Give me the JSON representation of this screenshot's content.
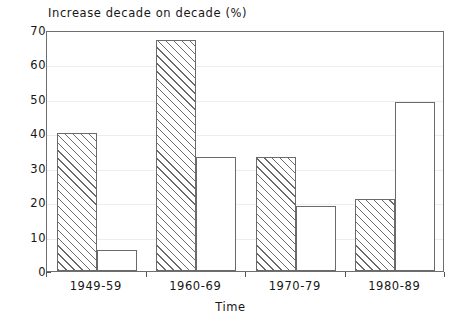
{
  "chart_data": {
    "type": "bar",
    "title": "Increase decade on decade (%)",
    "xlabel": "Time",
    "ylabel": "",
    "categories": [
      "1949-59",
      "1960-69",
      "1970-79",
      "1980-89"
    ],
    "series": [
      {
        "name": "series-1-hatched",
        "style": "hatched",
        "values": [
          40,
          67,
          33,
          21
        ]
      },
      {
        "name": "series-2-plain",
        "style": "plain",
        "values": [
          6,
          33,
          19,
          49
        ]
      }
    ],
    "ylim": [
      0,
      70
    ],
    "yticks": [
      0,
      10,
      20,
      30,
      40,
      50,
      60,
      70
    ],
    "ytick_labels": [
      "0",
      "10",
      "20",
      "30",
      "40",
      "50",
      "60",
      "70"
    ],
    "grid": true,
    "grid_axis": "y",
    "legend": "none",
    "colors": {
      "axis": "#6e6e6e",
      "grid": "#ededed",
      "bar_edge": "#6a6a6a",
      "bar_fill": "#ffffff",
      "text": "#161616",
      "background": "#ffffff"
    }
  }
}
